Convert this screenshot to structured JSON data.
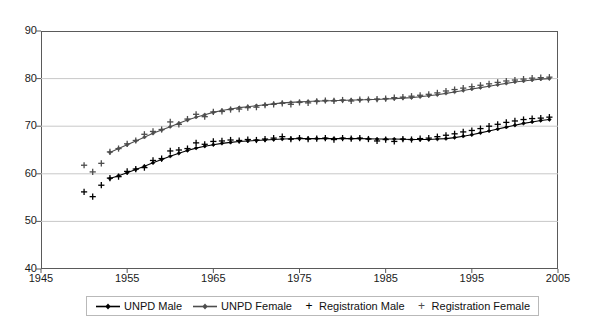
{
  "chart_data": {
    "type": "scatter",
    "title": "",
    "xlabel": "",
    "ylabel": "",
    "xlim": [
      1945,
      2005
    ],
    "ylim": [
      40,
      90
    ],
    "xticks": [
      1945,
      1955,
      1965,
      1975,
      1985,
      1995,
      2005
    ],
    "yticks": [
      40,
      50,
      60,
      70,
      80,
      90
    ],
    "grid": "horizontal",
    "legend_position": "bottom",
    "series": [
      {
        "name": "UNPD Male",
        "style": "line-marker",
        "marker": "diamond",
        "color": "#000000",
        "x": [
          1953,
          1954,
          1955,
          1956,
          1957,
          1958,
          1959,
          1960,
          1961,
          1962,
          1963,
          1964,
          1965,
          1966,
          1967,
          1968,
          1969,
          1970,
          1971,
          1972,
          1973,
          1974,
          1975,
          1976,
          1977,
          1978,
          1979,
          1980,
          1981,
          1982,
          1983,
          1984,
          1985,
          1986,
          1987,
          1988,
          1989,
          1990,
          1991,
          1992,
          1993,
          1994,
          1995,
          1996,
          1997,
          1998,
          1999,
          2000,
          2001,
          2002,
          2003,
          2004
        ],
        "y": [
          59.0,
          59.6,
          60.2,
          60.9,
          61.6,
          62.3,
          63.0,
          63.7,
          64.3,
          64.9,
          65.4,
          65.8,
          66.1,
          66.4,
          66.6,
          66.8,
          66.9,
          67.0,
          67.1,
          67.2,
          67.3,
          67.35,
          67.4,
          67.4,
          67.4,
          67.4,
          67.4,
          67.4,
          67.4,
          67.4,
          67.35,
          67.3,
          67.3,
          67.3,
          67.25,
          67.2,
          67.2,
          67.2,
          67.3,
          67.4,
          67.6,
          67.9,
          68.2,
          68.6,
          69.0,
          69.4,
          69.8,
          70.2,
          70.6,
          70.9,
          71.2,
          71.4
        ]
      },
      {
        "name": "UNPD Female",
        "style": "line-marker",
        "marker": "diamond",
        "color": "#4d4d4d",
        "x": [
          1953,
          1954,
          1955,
          1956,
          1957,
          1958,
          1959,
          1960,
          1961,
          1962,
          1963,
          1964,
          1965,
          1966,
          1967,
          1968,
          1969,
          1970,
          1971,
          1972,
          1973,
          1974,
          1975,
          1976,
          1977,
          1978,
          1979,
          1980,
          1981,
          1982,
          1983,
          1984,
          1985,
          1986,
          1987,
          1988,
          1989,
          1990,
          1991,
          1992,
          1993,
          1994,
          1995,
          1996,
          1997,
          1998,
          1999,
          2000,
          2001,
          2002,
          2003,
          2004
        ],
        "y": [
          64.5,
          65.3,
          66.1,
          66.9,
          67.7,
          68.5,
          69.2,
          69.9,
          70.6,
          71.3,
          71.9,
          72.4,
          72.9,
          73.3,
          73.6,
          73.9,
          74.1,
          74.3,
          74.5,
          74.7,
          74.9,
          75.0,
          75.1,
          75.2,
          75.3,
          75.3,
          75.4,
          75.4,
          75.5,
          75.5,
          75.6,
          75.6,
          75.7,
          75.8,
          75.9,
          76.0,
          76.2,
          76.4,
          76.6,
          76.9,
          77.2,
          77.5,
          77.8,
          78.1,
          78.4,
          78.7,
          79.0,
          79.3,
          79.5,
          79.7,
          79.9,
          80.0
        ]
      },
      {
        "name": "Registration Male",
        "style": "marker-only",
        "marker": "plus",
        "color": "#000000",
        "x": [
          1950,
          1951,
          1952,
          1953,
          1954,
          1955,
          1956,
          1957,
          1958,
          1959,
          1960,
          1961,
          1962,
          1963,
          1964,
          1965,
          1966,
          1967,
          1968,
          1969,
          1970,
          1971,
          1972,
          1973,
          1974,
          1975,
          1976,
          1977,
          1978,
          1979,
          1980,
          1981,
          1982,
          1983,
          1984,
          1985,
          1986,
          1987,
          1988,
          1989,
          1990,
          1991,
          1992,
          1993,
          1994,
          1995,
          1996,
          1997,
          1998,
          1999,
          2000,
          2001,
          2002,
          2003,
          2004
        ],
        "y": [
          56.2,
          55.2,
          57.6,
          59.1,
          59.4,
          60.5,
          61.0,
          61.3,
          62.8,
          63.2,
          64.8,
          65.0,
          65.3,
          66.5,
          66.2,
          66.8,
          66.9,
          67.1,
          67.0,
          67.2,
          67.1,
          67.3,
          67.5,
          67.8,
          67.3,
          67.5,
          67.3,
          67.4,
          67.5,
          67.2,
          67.5,
          67.4,
          67.5,
          67.3,
          66.9,
          67.2,
          66.8,
          67.3,
          67.2,
          67.4,
          67.5,
          67.8,
          68.1,
          68.4,
          68.8,
          69.1,
          69.5,
          70.0,
          70.4,
          70.8,
          71.1,
          71.4,
          71.6,
          71.7,
          71.9
        ]
      },
      {
        "name": "Registration Female",
        "style": "marker-only",
        "marker": "plus",
        "color": "#4d4d4d",
        "x": [
          1950,
          1951,
          1952,
          1953,
          1954,
          1955,
          1956,
          1957,
          1958,
          1959,
          1960,
          1961,
          1962,
          1963,
          1964,
          1965,
          1966,
          1967,
          1968,
          1969,
          1970,
          1971,
          1972,
          1973,
          1974,
          1975,
          1976,
          1977,
          1978,
          1979,
          1980,
          1981,
          1982,
          1983,
          1984,
          1985,
          1986,
          1987,
          1988,
          1989,
          1990,
          1991,
          1992,
          1993,
          1994,
          1995,
          1996,
          1997,
          1998,
          1999,
          2000,
          2001,
          2002,
          2003,
          2004
        ],
        "y": [
          61.8,
          60.4,
          62.2,
          64.6,
          65.3,
          66.3,
          67.0,
          68.3,
          68.9,
          69.3,
          70.9,
          70.4,
          71.5,
          72.5,
          72.0,
          73.0,
          73.1,
          73.5,
          73.6,
          73.9,
          74.0,
          74.4,
          74.6,
          74.8,
          74.6,
          75.0,
          74.9,
          75.2,
          75.4,
          75.3,
          75.5,
          75.3,
          75.6,
          75.6,
          75.7,
          75.8,
          76.0,
          76.1,
          76.3,
          76.5,
          76.7,
          77.0,
          77.4,
          77.7,
          78.0,
          78.3,
          78.6,
          78.9,
          79.2,
          79.5,
          79.7,
          79.9,
          80.1,
          80.2,
          80.3
        ]
      }
    ]
  },
  "axes": {
    "y_labels": [
      "90",
      "80",
      "70",
      "60",
      "50",
      "40"
    ],
    "x_labels": [
      "1945",
      "1955",
      "1965",
      "1975",
      "1985",
      "1995",
      "2005"
    ]
  },
  "legend": {
    "items": [
      {
        "label": "UNPD Male",
        "key": "line-diamond-marker",
        "color": "#000000"
      },
      {
        "label": "UNPD Female",
        "key": "line-diamond-marker",
        "color": "#4d4d4d"
      },
      {
        "label": "Registration Male",
        "key": "plus-marker",
        "color": "#000000"
      },
      {
        "label": "Registration Female",
        "key": "plus-marker",
        "color": "#4d4d4d"
      }
    ]
  },
  "colors": {
    "frame": "#5a5a5a",
    "gridline": "#c8c8c8",
    "male": "#000000",
    "female": "#4d4d4d",
    "background": "#ffffff"
  }
}
